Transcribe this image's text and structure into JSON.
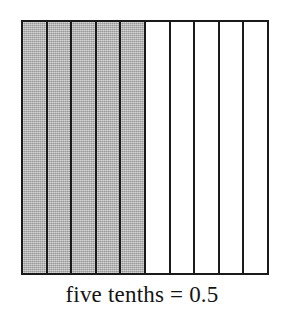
{
  "figure": {
    "caption": "five tenths = 0.5",
    "border_color": "#1a1a1a",
    "shaded_color": "#acacac",
    "unshaded_color": "#ffffff",
    "background_color": "#ffffff"
  },
  "chart_data": {
    "type": "bar",
    "title": "five tenths = 0.5",
    "xlabel": "",
    "ylabel": "",
    "orientation": "vertical-strips",
    "grid": false,
    "legend": null,
    "total_parts": 10,
    "shaded_parts": 5,
    "unshaded_parts": 5,
    "fraction": "5/10",
    "decimal": "0.5",
    "words": "five tenths",
    "categories": [
      "1",
      "2",
      "3",
      "4",
      "5",
      "6",
      "7",
      "8",
      "9",
      "10"
    ],
    "values": [
      1,
      1,
      1,
      1,
      1,
      1,
      1,
      1,
      1,
      1
    ],
    "series": [
      {
        "name": "shaded",
        "values": [
          1,
          1,
          1,
          1,
          1,
          0,
          0,
          0,
          0,
          0
        ]
      }
    ],
    "cells": [
      {
        "index": 1,
        "shaded": true,
        "fill": "#acacac"
      },
      {
        "index": 2,
        "shaded": true,
        "fill": "#acacac"
      },
      {
        "index": 3,
        "shaded": true,
        "fill": "#acacac"
      },
      {
        "index": 4,
        "shaded": true,
        "fill": "#acacac"
      },
      {
        "index": 5,
        "shaded": true,
        "fill": "#acacac"
      },
      {
        "index": 6,
        "shaded": false,
        "fill": "#ffffff"
      },
      {
        "index": 7,
        "shaded": false,
        "fill": "#ffffff"
      },
      {
        "index": 8,
        "shaded": false,
        "fill": "#ffffff"
      },
      {
        "index": 9,
        "shaded": false,
        "fill": "#ffffff"
      },
      {
        "index": 10,
        "shaded": false,
        "fill": "#ffffff"
      }
    ]
  }
}
